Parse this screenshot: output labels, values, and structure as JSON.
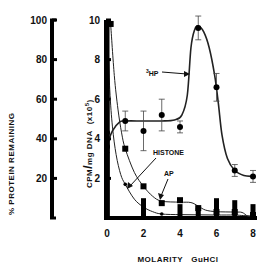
{
  "chart_data": {
    "type": "line",
    "title": "",
    "xlabel": "MOLARITY   GuHCl",
    "ylabel_left": "% PROTEIN   REMAINING",
    "ylabel_right": "CPM/mg DNA (x10^5)",
    "ylabel_right_parts": {
      "main": "CPM",
      "slash": "/",
      "unit": "mg  DNA",
      "mult": "(x10",
      "exp": "5",
      "close": ")"
    },
    "xlim": [
      0,
      8
    ],
    "ylim_left": [
      0,
      100
    ],
    "ylim_right": [
      0,
      10
    ],
    "x_ticks": [
      "0",
      "2",
      "4",
      "6",
      "8"
    ],
    "x_tick_values": [
      0,
      2,
      4,
      6,
      8
    ],
    "y_left_ticks": [
      "100",
      "80",
      "60",
      "40",
      "20"
    ],
    "y_left_tick_values": [
      100,
      80,
      60,
      40,
      20
    ],
    "y_right_ticks": [
      "10",
      "8",
      "6",
      "4",
      "2"
    ],
    "y_right_tick_values": [
      10,
      8,
      6,
      4,
      2
    ],
    "grid": false,
    "series": [
      {
        "name": "3HP",
        "label_sup": "3",
        "label_main": "HP",
        "marker": "circle",
        "points": [
          {
            "x": 0,
            "y": 4.3,
            "err": 0
          },
          {
            "x": 0,
            "y": 3.6,
            "err": 0.3
          },
          {
            "x": 1,
            "y": 4.9,
            "err": 0.5
          },
          {
            "x": 2,
            "y": 4.4,
            "err": 1.0
          },
          {
            "x": 3,
            "y": 5.2,
            "err": 0.8
          },
          {
            "x": 4,
            "y": 4.6,
            "err": 0.3
          },
          {
            "x": 5,
            "y": 9.6,
            "err": 0.6
          },
          {
            "x": 6,
            "y": 6.6,
            "err": 0.7
          },
          {
            "x": 7,
            "y": 2.4,
            "err": 0.3
          },
          {
            "x": 8,
            "y": 2.1,
            "err": 0.3
          }
        ],
        "curve": [
          [
            0,
            3.7
          ],
          [
            0.3,
            4.4
          ],
          [
            0.7,
            4.85
          ],
          [
            1,
            4.9
          ],
          [
            2,
            4.9
          ],
          [
            3,
            4.9
          ],
          [
            3.7,
            4.95
          ],
          [
            4.1,
            5.2
          ],
          [
            4.4,
            6.2
          ],
          [
            4.6,
            8.6
          ],
          [
            4.8,
            9.5
          ],
          [
            5,
            9.7
          ],
          [
            5.3,
            9.4
          ],
          [
            5.6,
            8.6
          ],
          [
            5.9,
            7.2
          ],
          [
            6.1,
            5.8
          ],
          [
            6.3,
            4.2
          ],
          [
            6.6,
            3.0
          ],
          [
            7,
            2.4
          ],
          [
            7.5,
            2.15
          ],
          [
            8,
            2.1
          ]
        ]
      },
      {
        "name": "HISTONE",
        "marker": "square",
        "points": [
          {
            "x": 0.2,
            "y": 9.8
          },
          {
            "x": 1,
            "y": 3.5
          },
          {
            "x": 2,
            "y": 1.6
          },
          {
            "x": 3,
            "y": 0.75
          },
          {
            "x": 4,
            "y": 0.9
          },
          {
            "x": 5,
            "y": 0.5
          },
          {
            "x": 6,
            "y": 0.3
          },
          {
            "x": 7,
            "y": 0.3
          },
          {
            "x": 8,
            "y": 0.15
          }
        ],
        "curve": [
          [
            0.2,
            9.8
          ],
          [
            0.4,
            7.2
          ],
          [
            0.6,
            5.5
          ],
          [
            0.8,
            4.3
          ],
          [
            1,
            3.5
          ],
          [
            1.5,
            2.3
          ],
          [
            2,
            1.6
          ],
          [
            2.5,
            1.1
          ],
          [
            3,
            0.85
          ],
          [
            4,
            0.8
          ],
          [
            4.6,
            0.78
          ],
          [
            5,
            0.6
          ],
          [
            5.4,
            0.4
          ],
          [
            6,
            0.32
          ],
          [
            7,
            0.3
          ],
          [
            7.4,
            0.28
          ],
          [
            7.7,
            0.1
          ],
          [
            8,
            0.05
          ]
        ]
      },
      {
        "name": "AP",
        "marker": "dot",
        "points": [
          {
            "x": 0,
            "y": 9.8
          },
          {
            "x": 1,
            "y": 1.7
          },
          {
            "x": 2,
            "y": 0.6
          },
          {
            "x": 3,
            "y": 0.2
          },
          {
            "x": 4,
            "y": 0.15
          },
          {
            "x": 5,
            "y": 0.2
          },
          {
            "x": 6,
            "y": 0.15
          },
          {
            "x": 7,
            "y": 0.15
          }
        ],
        "curve": [
          [
            0,
            9.8
          ],
          [
            0.15,
            6.5
          ],
          [
            0.3,
            4.6
          ],
          [
            0.5,
            3.2
          ],
          [
            0.75,
            2.2
          ],
          [
            1,
            1.7
          ],
          [
            1.5,
            0.95
          ],
          [
            2,
            0.55
          ],
          [
            2.5,
            0.32
          ],
          [
            3,
            0.2
          ],
          [
            4,
            0.17
          ],
          [
            5,
            0.16
          ],
          [
            6,
            0.15
          ],
          [
            7,
            0.15
          ],
          [
            7.5,
            0.12
          ],
          [
            8,
            0.1
          ]
        ]
      },
      {
        "name": "% protein remaining",
        "axis": "left",
        "marker": "bar",
        "points": [
          {
            "x": 0,
            "y": 100
          },
          {
            "x": 0,
            "y": 80
          },
          {
            "x": 0,
            "y": 40
          },
          {
            "x": 2,
            "y": 10
          },
          {
            "x": 4,
            "y": 7
          },
          {
            "x": 5,
            "y": 5
          },
          {
            "x": 6,
            "y": 10
          },
          {
            "x": 7,
            "y": 9
          },
          {
            "x": 8,
            "y": 7
          }
        ]
      }
    ],
    "annotations": [
      {
        "text": "HISTONE",
        "target": "HISTONE"
      },
      {
        "text": "AP",
        "target": "AP"
      },
      {
        "text": "3HP",
        "target": "3HP"
      }
    ]
  }
}
